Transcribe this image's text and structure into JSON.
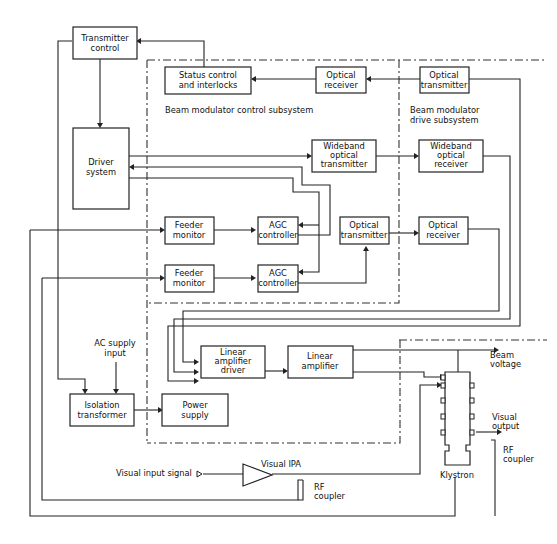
{
  "diagram": {
    "blocks": {
      "transmitter_control": [
        "Transmitter",
        "control"
      ],
      "status_control": [
        "Status control",
        "and interlocks"
      ],
      "optical_receiver_top": [
        "Optical",
        "receiver"
      ],
      "optical_transmitter_top": [
        "Optical",
        "transmitter"
      ],
      "driver_system": [
        "Driver",
        "system"
      ],
      "wideband_tx": [
        "Wideband",
        "optical",
        "transmitter"
      ],
      "wideband_rx": [
        "Wideband",
        "optical",
        "receiver"
      ],
      "feeder_monitor_1": [
        "Feeder",
        "monitor"
      ],
      "agc_controller_1": [
        "AGC",
        "controller"
      ],
      "optical_transmitter_mid": [
        "Optical",
        "transmitter"
      ],
      "optical_receiver_mid": [
        "Optical",
        "receiver"
      ],
      "feeder_monitor_2": [
        "Feeder",
        "monitor"
      ],
      "agc_controller_2": [
        "AGC",
        "controller"
      ],
      "linear_amp_driver": [
        "Linear",
        "amplifier",
        "driver"
      ],
      "linear_amp": [
        "Linear",
        "amplifier"
      ],
      "isolation_transformer": [
        "Isolation",
        "transformer"
      ],
      "power_supply": [
        "Power",
        "supply"
      ]
    },
    "labels": {
      "control_subsystem": "Beam modulator control subsystem",
      "drive_subsystem": [
        "Beam modulator",
        "drive subsystem"
      ],
      "ac_supply": [
        "AC supply",
        "input"
      ],
      "beam_voltage": [
        "Beam",
        "voltage"
      ],
      "visual_output": [
        "Visual",
        "output"
      ],
      "rf_coupler_right": [
        "RF",
        "coupler"
      ],
      "rf_coupler_bottom": [
        "RF",
        "coupler"
      ],
      "klystron": "Klystron",
      "visual_ipa": "Visual IPA",
      "visual_input_signal": "Visual input signal"
    }
  }
}
